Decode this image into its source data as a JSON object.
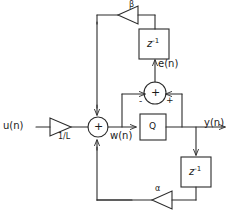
{
  "diagram": {
    "type": "signal-flow-block-diagram",
    "colors": {
      "background": "#ffffff",
      "stroke": "#2b2b2b",
      "text": "#1a1a1a"
    },
    "signals": {
      "input": "u(n)",
      "node_w": "w(n)",
      "error": "e(n)",
      "output": "y(n)"
    },
    "gains": {
      "input_gain": "1/L",
      "error_feedback_gain": "β",
      "output_feedback_gain": "α"
    },
    "blocks": {
      "quantizer": "Q",
      "delay_error": "z",
      "delay_error_exp": "-1",
      "delay_output": "z",
      "delay_output_exp": "-1"
    },
    "adders": {
      "main": {
        "center_sign": "+",
        "inputs": [
          "u(n)/L (left)",
          "β path (top)",
          "α path (bottom)"
        ]
      },
      "error": {
        "center_sign": "+",
        "minus_label": "-",
        "plus_label": "+"
      }
    }
  }
}
